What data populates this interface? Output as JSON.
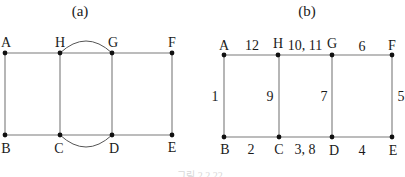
{
  "figure_a": {
    "title": "(a)",
    "nodes": {
      "A": {
        "label": "A"
      },
      "H": {
        "label": "H"
      },
      "G": {
        "label": "G"
      },
      "F": {
        "label": "F"
      },
      "B": {
        "label": "B"
      },
      "C": {
        "label": "C"
      },
      "D": {
        "label": "D"
      },
      "E": {
        "label": "E"
      }
    },
    "edges": [
      "A-H",
      "H-G",
      "H-G (arc)",
      "G-F",
      "A-B",
      "H-C",
      "G-D",
      "F-E",
      "B-C",
      "C-D",
      "C-D (arc)",
      "D-E"
    ]
  },
  "figure_b": {
    "title": "(b)",
    "nodes": {
      "A": {
        "label": "A"
      },
      "H": {
        "label": "H"
      },
      "G": {
        "label": "G"
      },
      "F": {
        "label": "F"
      },
      "B": {
        "label": "B"
      },
      "C": {
        "label": "C"
      },
      "D": {
        "label": "D"
      },
      "E": {
        "label": "E"
      }
    },
    "edge_labels": {
      "AH": "12",
      "HG": "10, 11",
      "GF": "6",
      "AB": "1",
      "HC": "9",
      "GD": "7",
      "FE": "5",
      "BC": "2",
      "CD": "3, 8",
      "DE": "4"
    }
  },
  "caption": "그림 2.2.22"
}
